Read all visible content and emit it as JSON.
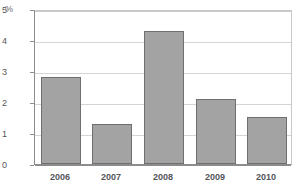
{
  "chart_data": {
    "type": "bar",
    "title": "",
    "subtitle": "",
    "unit_label": "%",
    "xlabel": "",
    "ylabel": "%",
    "categories": [
      "2006",
      "2007",
      "2008",
      "2009",
      "2010"
    ],
    "values": [
      2.8,
      1.3,
      4.3,
      2.1,
      1.5
    ],
    "series": [
      {
        "name": "",
        "values": [
          2.8,
          1.3,
          4.3,
          2.1,
          1.5
        ]
      }
    ],
    "ylim": [
      0,
      5
    ],
    "yticks": [
      "0",
      "1",
      "2",
      "3",
      "4",
      "5"
    ],
    "ytick_values": [
      0,
      1,
      2,
      3,
      4,
      5
    ],
    "grid": "horizontal",
    "legend": "none",
    "colors": {
      "bar_fill": "#a3a3a3",
      "bar_border": "#6f6f6f",
      "gridline": "#d5d5d5",
      "axis": "#8c8c8c",
      "frame": "#c9c9c9",
      "text": "#55565a",
      "background": "#ffffff"
    }
  }
}
